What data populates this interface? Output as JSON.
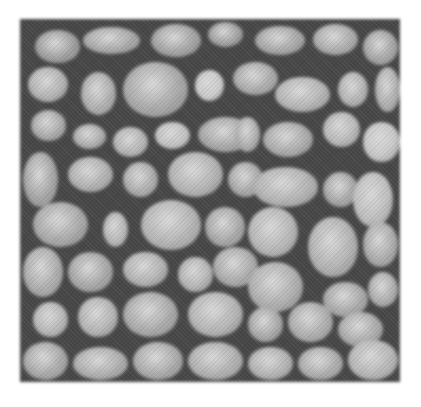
{
  "image": {
    "description": "Grayscale micrograph showing densely packed rounded grains separated by dark boundaries",
    "frame": {
      "x": 20,
      "y": 19,
      "width": 380,
      "height": 363
    },
    "colors": {
      "background": "#ffffff",
      "boundary": "#4a4a4a",
      "grain_light": "#b8b8b8",
      "grain_mid": "#9a9a9a",
      "highlight": "#d6d6d6"
    },
    "grains": [
      [
        12,
        8,
        50,
        38,
        "#9c9c9c"
      ],
      [
        60,
        5,
        62,
        32,
        "#a6a6a6"
      ],
      [
        128,
        2,
        55,
        38,
        "#a0a0a0"
      ],
      [
        185,
        0,
        40,
        30,
        "#9e9e9e"
      ],
      [
        232,
        4,
        55,
        34,
        "#a4a4a4"
      ],
      [
        290,
        2,
        50,
        36,
        "#a8a8a8"
      ],
      [
        340,
        8,
        40,
        40,
        "#a2a2a2"
      ],
      [
        5,
        45,
        45,
        40,
        "#b0b0b0"
      ],
      [
        58,
        50,
        40,
        48,
        "#acacac"
      ],
      [
        100,
        40,
        70,
        60,
        "#a6a6a6"
      ],
      [
        172,
        48,
        34,
        36,
        "#c8c8c8"
      ],
      [
        210,
        40,
        50,
        38,
        "#a8a8a8"
      ],
      [
        252,
        55,
        60,
        40,
        "#b2b2b2"
      ],
      [
        315,
        50,
        35,
        40,
        "#b0b0b0"
      ],
      [
        352,
        45,
        30,
        50,
        "#acacac"
      ],
      [
        8,
        88,
        40,
        36,
        "#a8a8a8"
      ],
      [
        50,
        102,
        38,
        30,
        "#aaaaaa"
      ],
      [
        90,
        105,
        40,
        35,
        "#b2b2b2"
      ],
      [
        132,
        100,
        40,
        32,
        "#c0c0c0"
      ],
      [
        175,
        95,
        60,
        40,
        "#a4a4a4"
      ],
      [
        212,
        95,
        30,
        40,
        "#aaaaaa"
      ],
      [
        240,
        100,
        55,
        40,
        "#a8a8a8"
      ],
      [
        300,
        90,
        42,
        40,
        "#b6b6b6"
      ],
      [
        340,
        100,
        42,
        45,
        "#c4c4c4"
      ],
      [
        0,
        130,
        40,
        60,
        "#a2a2a2"
      ],
      [
        45,
        135,
        50,
        40,
        "#aeaeae"
      ],
      [
        100,
        140,
        40,
        40,
        "#aaaaaa"
      ],
      [
        145,
        130,
        60,
        50,
        "#b0b0b0"
      ],
      [
        205,
        140,
        40,
        40,
        "#a6a6a6"
      ],
      [
        230,
        145,
        70,
        45,
        "#b0b0b0"
      ],
      [
        300,
        150,
        40,
        40,
        "#a4a4a4"
      ],
      [
        330,
        150,
        45,
        60,
        "#bcbcbc"
      ],
      [
        10,
        180,
        60,
        50,
        "#a6a6a6"
      ],
      [
        80,
        190,
        30,
        40,
        "#b4b4b4"
      ],
      [
        118,
        178,
        65,
        55,
        "#b2b2b2"
      ],
      [
        182,
        185,
        45,
        45,
        "#a6a6a6"
      ],
      [
        225,
        185,
        55,
        55,
        "#b4b4b4"
      ],
      [
        285,
        195,
        55,
        65,
        "#b0b0b0"
      ],
      [
        340,
        200,
        40,
        50,
        "#a8a8a8"
      ],
      [
        0,
        225,
        45,
        55,
        "#aaaaaa"
      ],
      [
        45,
        230,
        50,
        45,
        "#a4a4a4"
      ],
      [
        100,
        230,
        50,
        40,
        "#b0b0b0"
      ],
      [
        155,
        235,
        40,
        40,
        "#b2b2b2"
      ],
      [
        190,
        225,
        50,
        45,
        "#a8a8a8"
      ],
      [
        225,
        240,
        60,
        55,
        "#acacac"
      ],
      [
        300,
        260,
        50,
        40,
        "#a6a6a6"
      ],
      [
        345,
        250,
        35,
        40,
        "#aaaaaa"
      ],
      [
        10,
        280,
        40,
        40,
        "#b4b4b4"
      ],
      [
        55,
        275,
        45,
        45,
        "#b2b2b2"
      ],
      [
        100,
        270,
        60,
        50,
        "#a8a8a8"
      ],
      [
        165,
        270,
        60,
        50,
        "#b2b2b2"
      ],
      [
        225,
        285,
        40,
        40,
        "#a6a6a6"
      ],
      [
        265,
        280,
        50,
        45,
        "#aaaaaa"
      ],
      [
        315,
        290,
        50,
        40,
        "#a8a8a8"
      ],
      [
        0,
        320,
        50,
        43,
        "#a6a6a6"
      ],
      [
        50,
        325,
        60,
        38,
        "#acacac"
      ],
      [
        110,
        320,
        55,
        43,
        "#a8a8a8"
      ],
      [
        165,
        320,
        60,
        43,
        "#aeaeae"
      ],
      [
        225,
        325,
        50,
        38,
        "#b0b0b0"
      ],
      [
        275,
        325,
        50,
        38,
        "#aaaaaa"
      ],
      [
        325,
        318,
        55,
        45,
        "#b4b4b4"
      ]
    ]
  }
}
